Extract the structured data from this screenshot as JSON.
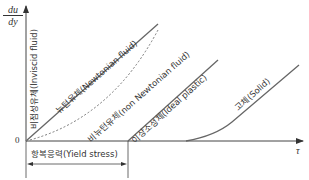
{
  "diagram": {
    "y_axis_label_num": "du",
    "y_axis_label_den": "dy",
    "x_axis_label": "τ",
    "origin_label": "0",
    "yield_stress_label": "항복응력(Yield stress)",
    "curves": [
      {
        "name": "inviscid",
        "label": "비점성유체(Inviscid fluid)",
        "style": "solid"
      },
      {
        "name": "newtonian",
        "label": "뉴턴유체(Newtonian fluid)",
        "style": "solid"
      },
      {
        "name": "non-newtonian",
        "label": "비뉴턴유체(non Newtonian fluid)",
        "style": "dashed"
      },
      {
        "name": "ideal-plastic",
        "label": "이상소성체(Ideal plastic)",
        "style": "solid"
      },
      {
        "name": "solid",
        "label": "고체(Solid)",
        "style": "solid"
      }
    ],
    "colors": {
      "line": "#555555",
      "text": "#333333"
    }
  }
}
